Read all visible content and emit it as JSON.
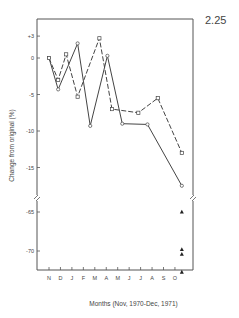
{
  "figure_number": "2.25",
  "chart_data": {
    "type": "line",
    "title": "",
    "xlabel": "Months (Nov, 1970-Dec, 1971)",
    "ylabel": "Change from original (%)",
    "x_tick_labels": [
      "N",
      "D",
      "J",
      "F",
      "M",
      "A",
      "M",
      "J",
      "J",
      "A",
      "S",
      "O"
    ],
    "y_ticks_upper": [
      "+3",
      "0",
      "-5",
      "-10",
      "-15"
    ],
    "y_ticks_lower": [
      "-65",
      "-70"
    ],
    "axis_break": true,
    "grid": false,
    "legend": null,
    "series": [
      {
        "name": "solid line (open circles)",
        "style": "solid",
        "marker": "open-circle",
        "x": [
          0,
          0.8,
          2.5,
          3.6,
          5.1,
          6.4,
          8.6,
          11.6
        ],
        "values": [
          0,
          -4.3,
          2.0,
          -9.3,
          0.3,
          -9.0,
          -9.1,
          -17.5
        ]
      },
      {
        "name": "dashed line (open squares)",
        "style": "dashed",
        "marker": "open-square",
        "x": [
          0,
          0.8,
          1.5,
          2.5,
          4.4,
          5.5,
          7.8,
          9.5,
          11.6
        ],
        "values": [
          0,
          -3.0,
          0.5,
          -5.3,
          2.7,
          -7.0,
          -7.5,
          -5.5,
          -13.0
        ]
      },
      {
        "name": "triangles",
        "style": "none",
        "marker": "filled-triangle",
        "x": [
          11.6,
          11.6,
          11.6,
          11.6
        ],
        "values": [
          -65.0,
          -69.8,
          -70.4,
          -72.7
        ]
      }
    ],
    "ylim_upper": [
      -18,
      4.5
    ],
    "ylim_lower": [
      -74,
      -63
    ]
  }
}
